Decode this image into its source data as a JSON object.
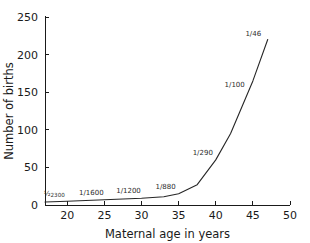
{
  "chart_data": {
    "type": "line",
    "title": "",
    "subtitle": "",
    "xlabel": "Maternal age in years",
    "ylabel": "Number of births",
    "xlim": [
      17,
      50
    ],
    "ylim": [
      0,
      250
    ],
    "grid": false,
    "legend": "none",
    "xticks": [
      20,
      25,
      30,
      35,
      40,
      45,
      50
    ],
    "xtick_labels": [
      "20",
      "25",
      "30",
      "35",
      "40",
      "45",
      "50"
    ],
    "yticks": [
      0,
      50,
      100,
      150,
      200,
      250
    ],
    "ytick_labels": [
      "0",
      "50",
      "100",
      "150",
      "200",
      "250"
    ],
    "series": [
      {
        "name": "Number of births",
        "x": [
          17,
          20,
          25,
          30,
          33,
          35,
          37.5,
          40,
          42,
          45,
          47
        ],
        "values": [
          4,
          5,
          7,
          9,
          11,
          15,
          27,
          60,
          95,
          165,
          220
        ]
      }
    ],
    "annotations": [
      {
        "text": "1/2300",
        "numerator": "1",
        "denominator": "2300",
        "style": "vulgar-fraction",
        "x": 20.0,
        "y": 5
      },
      {
        "text": "1/1600",
        "numerator": "1",
        "denominator": "1600",
        "style": "slash",
        "x": 25.0,
        "y": 7
      },
      {
        "text": "1/1200",
        "numerator": "1",
        "denominator": "1200",
        "style": "slash",
        "x": 30.0,
        "y": 9
      },
      {
        "text": "1/880",
        "numerator": "1",
        "denominator": "880",
        "style": "slash",
        "x": 35.0,
        "y": 15
      },
      {
        "text": "1/290",
        "numerator": "1",
        "denominator": "290",
        "style": "slash",
        "x": 40.0,
        "y": 60
      },
      {
        "text": "1/100",
        "numerator": "1",
        "denominator": "100",
        "style": "slash",
        "x": 44.3,
        "y": 150
      },
      {
        "text": "1/46",
        "numerator": "1",
        "denominator": "46",
        "style": "slash",
        "x": 46.8,
        "y": 218
      }
    ],
    "colors": {
      "line": "#262626",
      "axis": "#1a1a1a",
      "text": "#1a1a1a",
      "annotation": "#2b2b2b",
      "background": "#ffffff"
    }
  }
}
